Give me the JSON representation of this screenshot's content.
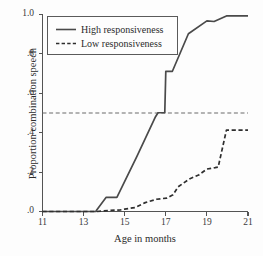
{
  "chart_data": {
    "type": "line",
    "title": "",
    "xlabel": "Age in months",
    "ylabel": "Proportion combination speech",
    "xlim": [
      11,
      21
    ],
    "ylim": [
      0,
      1.0
    ],
    "xticks": [
      "11",
      "13",
      "15",
      "17",
      "19",
      "21"
    ],
    "xtick_values": [
      11,
      13,
      15,
      17,
      19,
      21
    ],
    "yticks": [
      "1.0",
      ".8",
      ".6",
      ".4",
      ".2",
      ".0"
    ],
    "ytick_values": [
      1.0,
      0.8,
      0.6,
      0.4,
      0.2,
      0.0
    ],
    "grid": false,
    "legend_position": "upper-left",
    "annotations": [
      {
        "name": "median-reference-line",
        "type": "hline",
        "y": 0.5,
        "style": "dashed",
        "label": ""
      }
    ],
    "series": [
      {
        "name": "High responsiveness",
        "style": "solid",
        "color": "#4a4a4a",
        "x": [
          11.0,
          13.6,
          13.62,
          14.1,
          14.62,
          15.6,
          16.5,
          16.62,
          16.95,
          17.0,
          17.32,
          18.1,
          19.0,
          19.35,
          19.95,
          21.0
        ],
        "values": [
          0.0,
          0.0,
          0.005,
          0.072,
          0.072,
          0.28,
          0.48,
          0.5,
          0.5,
          0.71,
          0.71,
          0.9,
          0.965,
          0.962,
          0.99,
          0.99
        ]
      },
      {
        "name": "Low responsiveness",
        "style": "dashed",
        "color": "#2e2e2e",
        "x": [
          11.0,
          13.65,
          14.2,
          14.8,
          15.0,
          15.5,
          16.0,
          16.55,
          17.05,
          17.35,
          17.6,
          18.15,
          18.6,
          19.0,
          19.4,
          19.55,
          19.95,
          21.0
        ],
        "values": [
          0.0,
          0.0,
          0.005,
          0.008,
          0.012,
          0.02,
          0.045,
          0.062,
          0.068,
          0.085,
          0.125,
          0.165,
          0.185,
          0.215,
          0.222,
          0.225,
          0.412,
          0.412
        ]
      }
    ]
  },
  "legend": {
    "items": [
      {
        "label": "High responsiveness",
        "style": "solid"
      },
      {
        "label": "Low responsiveness",
        "style": "dashed"
      }
    ]
  },
  "axes": {
    "x_title": "Age in months",
    "y_title": "Proportion combination speech",
    "x_tick_labels": [
      "11",
      "13",
      "15",
      "17",
      "19",
      "21"
    ],
    "y_tick_labels": [
      "1.0",
      ".8",
      ".6",
      ".4",
      ".2",
      ".0"
    ]
  }
}
